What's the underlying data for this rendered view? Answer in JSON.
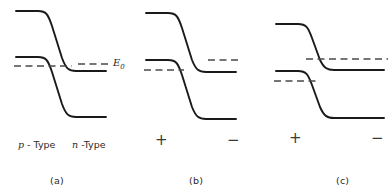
{
  "figure": {
    "type": "semiconductor-energy-band-diagram",
    "width": 391,
    "height": 195,
    "background_color": "#ffffff",
    "band_color": "#1a1a1a",
    "fermi_color": "#4a4a4a"
  },
  "panels": [
    {
      "id": "a",
      "caption": "(a)",
      "caption_x": 50,
      "caption_y": 175,
      "left_type_label_prefix": "p",
      "left_type_label_suffix": " - Type",
      "right_type_label_prefix": "n",
      "right_type_label_suffix": " -Type",
      "left_type_x": 18,
      "right_type_x": 72,
      "type_label_y": 139,
      "fermi_symbol": "E",
      "fermi_subscript": "0",
      "fermi_label_x": 113,
      "fermi_label_y": 57,
      "conduction_path": "M 16 11 L 38 11 C 46 11 48 14 52 26 L 62 58 C 66 69 69 71 76 71 L 106 71",
      "valence_path": "M 16 57 L 38 57 C 46 57 48 60 52 72 L 62 104 C 66 115 69 117 76 117 L 106 117",
      "fermi_paths": [
        "M 14 66 L 72 66",
        "M 78 64 L 110 64"
      ],
      "fermi_single_level": true,
      "polarity_left": null,
      "polarity_right": null
    },
    {
      "id": "b",
      "caption": "(b)",
      "caption_x": 189,
      "caption_y": 175,
      "left_type_label_prefix": null,
      "left_type_label_suffix": null,
      "right_type_label_prefix": null,
      "right_type_label_suffix": null,
      "fermi_symbol": null,
      "fermi_subscript": null,
      "conduction_path": "M 146 13 L 168 13 C 176 13 178 16 182 28 L 192 60 C 196 70 199 72 206 72 L 236 72",
      "valence_path": "M 146 60 L 168 60 C 176 60 178 63 182 75 L 192 107 C 196 117 199 119 206 119 L 236 119",
      "fermi_paths": [
        "M 144 70 L 184 70",
        "M 208 60 L 240 60"
      ],
      "fermi_single_level": false,
      "polarity_left": "+",
      "polarity_right": "−",
      "polarity_left_x": 155,
      "polarity_right_x": 227,
      "polarity_y": 133
    },
    {
      "id": "c",
      "caption": "(c)",
      "caption_x": 336,
      "caption_y": 175,
      "left_type_label_prefix": null,
      "left_type_label_suffix": null,
      "right_type_label_prefix": null,
      "right_type_label_suffix": null,
      "fermi_symbol": null,
      "fermi_subscript": null,
      "conduction_path": "M 276 24 L 298 24 C 306 24 308 27 312 38 L 320 60 C 324 68 327 70 334 70 L 384 70",
      "valence_path": "M 276 71 L 298 71 C 306 71 308 74 312 85 L 320 107 C 324 116 327 118 334 118 L 384 118",
      "fermi_paths": [
        "M 306 59 L 388 59",
        "M 274 81 L 318 81"
      ],
      "fermi_single_level": false,
      "polarity_left": "+",
      "polarity_right": "−",
      "polarity_left_x": 289,
      "polarity_right_x": 371,
      "polarity_y": 131
    }
  ]
}
